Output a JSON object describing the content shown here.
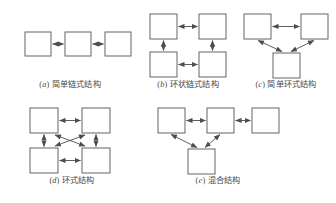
{
  "figure": {
    "background_color": "#ffffff",
    "box_stroke_color": "#555555",
    "box_fill_color": "#ffffff",
    "arrow_color": "#4d4d4d",
    "caption_color": "#4a4a4a",
    "panel_count": 5
  },
  "panels": [
    {
      "id": "a",
      "index_label": "a",
      "caption_prefix": "(",
      "caption_suffix": ")",
      "caption_text": "简单链式结构",
      "full_caption": "(a) 简单链式结构",
      "node_count": 3,
      "layout": "horizontal-chain",
      "edges": "node1<->node2, node2<->node3"
    },
    {
      "id": "b",
      "index_label": "b",
      "caption_prefix": "(",
      "caption_suffix": ")",
      "caption_text": "环状链式结构",
      "full_caption": "(b) 环状链式结构",
      "node_count": 4,
      "layout": "2x2-ring",
      "edges": "top-left<->top-right, top-right<->bottom-right, bottom-right<->bottom-left, bottom-left<->top-left"
    },
    {
      "id": "c",
      "index_label": "c",
      "caption_prefix": "(",
      "caption_suffix": ")",
      "caption_text": "简单环式结构",
      "full_caption": "(c) 简单环式结构",
      "node_count": 3,
      "layout": "triangle",
      "edges": "top-left<->top-right, top-left<->bottom-center, top-right<->bottom-center"
    },
    {
      "id": "d",
      "index_label": "d",
      "caption_prefix": "(",
      "caption_suffix": ")",
      "caption_text": "环式结构",
      "full_caption": "(d) 环式结构",
      "node_count": 4,
      "layout": "2x2-full-mesh",
      "edges": "all four sides plus both diagonals, bidirectional"
    },
    {
      "id": "e",
      "index_label": "e",
      "caption_prefix": "(",
      "caption_suffix": ")",
      "caption_text": "混合结构",
      "full_caption": "(e) 混合结构",
      "node_count": 4,
      "layout": "chain-plus-triangle",
      "edges": "left<->middle, middle<->right, left<->bottom, middle<->bottom"
    }
  ]
}
